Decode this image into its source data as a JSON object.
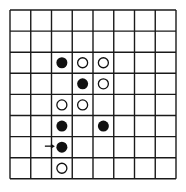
{
  "board": {
    "cols": 8,
    "rows": 8,
    "origin_x": 10,
    "origin_y": 10,
    "cell_w": 20.75,
    "cell_h": 21.1,
    "line_color": "#1a1a1a",
    "background": "#ffffff"
  },
  "stones": [
    {
      "col": 2,
      "row": 2,
      "color": "black"
    },
    {
      "col": 3,
      "row": 2,
      "color": "white"
    },
    {
      "col": 4,
      "row": 2,
      "color": "white"
    },
    {
      "col": 3,
      "row": 3,
      "color": "black"
    },
    {
      "col": 4,
      "row": 3,
      "color": "white"
    },
    {
      "col": 2,
      "row": 4,
      "color": "white"
    },
    {
      "col": 3,
      "row": 4,
      "color": "white"
    },
    {
      "col": 2,
      "row": 5,
      "color": "black"
    },
    {
      "col": 4,
      "row": 5,
      "color": "black"
    },
    {
      "col": 2,
      "row": 6,
      "color": "black"
    },
    {
      "col": 2,
      "row": 7,
      "color": "white"
    }
  ],
  "marker": {
    "type": "arrow",
    "points_to": {
      "col": 2,
      "row": 6
    },
    "direction": "right"
  }
}
